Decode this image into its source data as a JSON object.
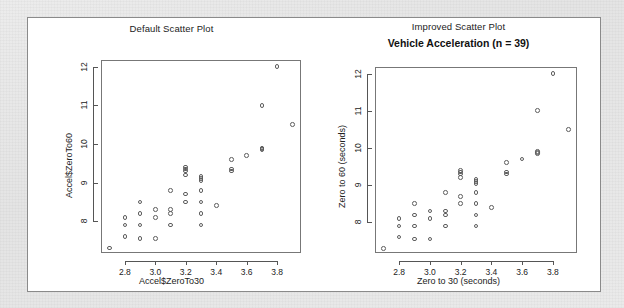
{
  "figure": {
    "background_color": "#ffffff",
    "outer_color": "#e8e8e8",
    "point_color": "#5d5d5d",
    "axis_color": "#555555"
  },
  "panels": [
    {
      "id": "default",
      "plot_title": "Default Scatter Plot",
      "main_title": "",
      "xlabel": "Accel$ZeroTo30",
      "ylabel": "Accel$ZeroTo60"
    },
    {
      "id": "improved",
      "plot_title": "Improved Scatter Plot",
      "main_title": "Vehicle Acceleration (n = 39)",
      "xlabel": "Zero to 30 (seconds)",
      "ylabel": "Zero to 60 (seconds)"
    }
  ],
  "chart_data": {
    "type": "scatter",
    "title": "Vehicle Acceleration (n = 39)",
    "subtitle_left": "Default Scatter Plot",
    "subtitle_right": "Improved Scatter Plot",
    "xlabel": "Zero to 30 (seconds)",
    "ylabel": "Zero to 60 (seconds)",
    "xlabel_default": "Accel$ZeroTo30",
    "ylabel_default": "Accel$ZeroTo60",
    "n": 39,
    "xlim": [
      2.65,
      3.95
    ],
    "ylim": [
      7.2,
      12.15
    ],
    "xticks": [
      2.8,
      3.0,
      3.2,
      3.4,
      3.6,
      3.8
    ],
    "yticks": [
      8,
      9,
      10,
      11,
      12
    ],
    "grid": false,
    "legend": false,
    "marker": "open-circle",
    "points": [
      {
        "x": 2.7,
        "y": 7.3
      },
      {
        "x": 2.8,
        "y": 8.1
      },
      {
        "x": 2.8,
        "y": 7.9
      },
      {
        "x": 2.8,
        "y": 7.6
      },
      {
        "x": 2.9,
        "y": 8.5
      },
      {
        "x": 2.9,
        "y": 8.2
      },
      {
        "x": 2.9,
        "y": 7.9
      },
      {
        "x": 2.9,
        "y": 7.55
      },
      {
        "x": 3.0,
        "y": 8.3
      },
      {
        "x": 3.0,
        "y": 8.1
      },
      {
        "x": 3.0,
        "y": 7.55
      },
      {
        "x": 3.1,
        "y": 8.8
      },
      {
        "x": 3.1,
        "y": 8.3
      },
      {
        "x": 3.1,
        "y": 8.2
      },
      {
        "x": 3.1,
        "y": 7.9
      },
      {
        "x": 3.2,
        "y": 9.4
      },
      {
        "x": 3.2,
        "y": 9.3
      },
      {
        "x": 3.2,
        "y": 9.2
      },
      {
        "x": 3.2,
        "y": 8.7
      },
      {
        "x": 3.2,
        "y": 8.5
      },
      {
        "x": 3.3,
        "y": 9.15
      },
      {
        "x": 3.3,
        "y": 9.05
      },
      {
        "x": 3.3,
        "y": 8.8
      },
      {
        "x": 3.3,
        "y": 8.5
      },
      {
        "x": 3.3,
        "y": 8.2
      },
      {
        "x": 3.3,
        "y": 7.9
      },
      {
        "x": 3.4,
        "y": 8.4
      },
      {
        "x": 3.5,
        "y": 9.6
      },
      {
        "x": 3.5,
        "y": 9.35
      },
      {
        "x": 3.5,
        "y": 9.3
      },
      {
        "x": 3.6,
        "y": 9.7
      },
      {
        "x": 3.7,
        "y": 9.9
      },
      {
        "x": 3.7,
        "y": 9.85
      },
      {
        "x": 3.7,
        "y": 11.0
      },
      {
        "x": 3.8,
        "y": 12.0
      },
      {
        "x": 3.9,
        "y": 10.5
      },
      {
        "x": 3.2,
        "y": 9.35
      },
      {
        "x": 3.3,
        "y": 9.1
      },
      {
        "x": 3.7,
        "y": 9.88
      }
    ]
  }
}
